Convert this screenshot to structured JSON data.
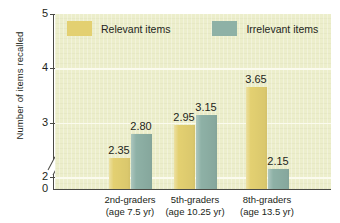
{
  "chart_data": {
    "type": "bar",
    "title": "",
    "subtitle": "",
    "xlabel": "",
    "ylabel": "Number of items recalled",
    "ylim": [
      0,
      5
    ],
    "y_ticks": [
      "0",
      "2",
      "3",
      "4",
      "5"
    ],
    "y_axis_break": true,
    "grid": "horizontal",
    "legend_position": "top-inside",
    "categories": [
      {
        "grade": "2nd-graders",
        "age": "(age 7.5 yr)"
      },
      {
        "grade": "5th-graders",
        "age": "(age 10.25 yr)"
      },
      {
        "grade": "8th-graders",
        "age": "(age 13.5 yr)"
      }
    ],
    "series": [
      {
        "name": "Relevant items",
        "color": "#e3d071",
        "values": [
          2.35,
          2.95,
          3.65
        ],
        "labels": [
          "2.35",
          "2.95",
          "3.65"
        ]
      },
      {
        "name": "Irrelevant items",
        "color": "#8eb1a6",
        "values": [
          2.8,
          3.15,
          2.15
        ],
        "labels": [
          "2.80",
          "3.15",
          "2.15"
        ]
      }
    ],
    "plot_background": "#eceecb",
    "gridline_color": "#fbfbee",
    "axis_color": "#4a4a45"
  }
}
